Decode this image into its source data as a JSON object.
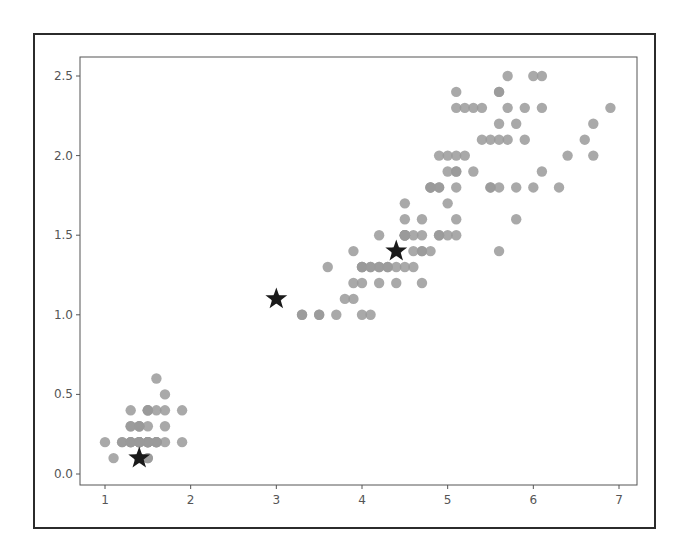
{
  "chart_data": {
    "type": "scatter",
    "title": "",
    "xlabel": "",
    "ylabel": "",
    "xlim": [
      0.705,
      7.195
    ],
    "ylim": [
      -0.07,
      2.62
    ],
    "grid": false,
    "legend": null,
    "x_ticks": [
      "1",
      "2",
      "3",
      "4",
      "5",
      "6",
      "7"
    ],
    "y_ticks": [
      "0.0",
      "0.5",
      "1.0",
      "1.5",
      "2.0",
      "2.5"
    ],
    "colors": {
      "points": "#9a9a9a",
      "stars": "#1a1a1a",
      "axes": "#555555",
      "frame": "#2b2b2b"
    },
    "series": [
      {
        "name": "points",
        "marker": "circle",
        "points": [
          [
            1.4,
            0.2
          ],
          [
            1.4,
            0.2
          ],
          [
            1.3,
            0.2
          ],
          [
            1.5,
            0.2
          ],
          [
            1.4,
            0.2
          ],
          [
            1.7,
            0.4
          ],
          [
            1.4,
            0.3
          ],
          [
            1.5,
            0.2
          ],
          [
            1.4,
            0.2
          ],
          [
            1.5,
            0.1
          ],
          [
            1.5,
            0.2
          ],
          [
            1.6,
            0.2
          ],
          [
            1.4,
            0.1
          ],
          [
            1.1,
            0.1
          ],
          [
            1.2,
            0.2
          ],
          [
            1.5,
            0.4
          ],
          [
            1.3,
            0.4
          ],
          [
            1.4,
            0.3
          ],
          [
            1.7,
            0.3
          ],
          [
            1.5,
            0.3
          ],
          [
            1.7,
            0.2
          ],
          [
            1.5,
            0.4
          ],
          [
            1.0,
            0.2
          ],
          [
            1.7,
            0.5
          ],
          [
            1.9,
            0.2
          ],
          [
            1.6,
            0.2
          ],
          [
            1.6,
            0.4
          ],
          [
            1.5,
            0.2
          ],
          [
            1.4,
            0.2
          ],
          [
            1.6,
            0.2
          ],
          [
            1.6,
            0.2
          ],
          [
            1.5,
            0.4
          ],
          [
            1.5,
            0.1
          ],
          [
            1.4,
            0.2
          ],
          [
            1.5,
            0.2
          ],
          [
            1.2,
            0.2
          ],
          [
            1.3,
            0.2
          ],
          [
            1.4,
            0.1
          ],
          [
            1.3,
            0.2
          ],
          [
            1.5,
            0.2
          ],
          [
            1.3,
            0.3
          ],
          [
            1.3,
            0.3
          ],
          [
            1.3,
            0.2
          ],
          [
            1.6,
            0.6
          ],
          [
            1.9,
            0.4
          ],
          [
            1.4,
            0.3
          ],
          [
            1.6,
            0.2
          ],
          [
            1.4,
            0.2
          ],
          [
            1.5,
            0.2
          ],
          [
            1.4,
            0.2
          ],
          [
            4.7,
            1.4
          ],
          [
            4.5,
            1.5
          ],
          [
            4.9,
            1.5
          ],
          [
            4.0,
            1.3
          ],
          [
            4.6,
            1.5
          ],
          [
            4.5,
            1.3
          ],
          [
            4.7,
            1.6
          ],
          [
            3.3,
            1.0
          ],
          [
            4.6,
            1.3
          ],
          [
            3.9,
            1.4
          ],
          [
            3.5,
            1.0
          ],
          [
            4.2,
            1.5
          ],
          [
            4.0,
            1.0
          ],
          [
            4.7,
            1.4
          ],
          [
            3.6,
            1.3
          ],
          [
            4.4,
            1.4
          ],
          [
            4.5,
            1.5
          ],
          [
            4.1,
            1.0
          ],
          [
            4.5,
            1.5
          ],
          [
            3.9,
            1.1
          ],
          [
            4.8,
            1.8
          ],
          [
            4.0,
            1.3
          ],
          [
            4.9,
            1.5
          ],
          [
            4.7,
            1.2
          ],
          [
            4.3,
            1.3
          ],
          [
            4.4,
            1.4
          ],
          [
            4.8,
            1.4
          ],
          [
            5.0,
            1.7
          ],
          [
            4.5,
            1.5
          ],
          [
            3.5,
            1.0
          ],
          [
            3.8,
            1.1
          ],
          [
            3.7,
            1.0
          ],
          [
            3.9,
            1.2
          ],
          [
            5.1,
            1.6
          ],
          [
            4.5,
            1.5
          ],
          [
            4.5,
            1.6
          ],
          [
            4.7,
            1.5
          ],
          [
            4.4,
            1.3
          ],
          [
            4.1,
            1.3
          ],
          [
            4.0,
            1.3
          ],
          [
            4.4,
            1.2
          ],
          [
            4.6,
            1.4
          ],
          [
            4.0,
            1.2
          ],
          [
            3.3,
            1.0
          ],
          [
            4.2,
            1.3
          ],
          [
            4.2,
            1.2
          ],
          [
            4.2,
            1.3
          ],
          [
            4.3,
            1.3
          ],
          [
            3.0,
            1.1
          ],
          [
            4.1,
            1.3
          ],
          [
            6.0,
            2.5
          ],
          [
            5.1,
            1.9
          ],
          [
            5.9,
            2.1
          ],
          [
            5.6,
            1.8
          ],
          [
            5.8,
            2.2
          ],
          [
            6.6,
            2.1
          ],
          [
            4.5,
            1.7
          ],
          [
            6.3,
            1.8
          ],
          [
            5.8,
            1.8
          ],
          [
            6.1,
            2.5
          ],
          [
            5.1,
            2.0
          ],
          [
            5.3,
            1.9
          ],
          [
            5.5,
            2.1
          ],
          [
            5.0,
            2.0
          ],
          [
            5.1,
            2.4
          ],
          [
            5.3,
            2.3
          ],
          [
            5.5,
            1.8
          ],
          [
            6.7,
            2.2
          ],
          [
            6.9,
            2.3
          ],
          [
            5.0,
            1.5
          ],
          [
            5.7,
            2.3
          ],
          [
            4.9,
            2.0
          ],
          [
            6.7,
            2.0
          ],
          [
            4.9,
            1.8
          ],
          [
            5.7,
            2.1
          ],
          [
            6.0,
            1.8
          ],
          [
            4.8,
            1.8
          ],
          [
            4.9,
            1.8
          ],
          [
            5.6,
            2.1
          ],
          [
            5.8,
            1.6
          ],
          [
            6.1,
            1.9
          ],
          [
            6.4,
            2.0
          ],
          [
            5.6,
            2.2
          ],
          [
            5.1,
            1.5
          ],
          [
            5.6,
            1.4
          ],
          [
            6.1,
            2.3
          ],
          [
            5.6,
            2.4
          ],
          [
            5.5,
            1.8
          ],
          [
            4.8,
            1.8
          ],
          [
            5.4,
            2.1
          ],
          [
            5.6,
            2.4
          ],
          [
            5.1,
            2.3
          ],
          [
            5.1,
            1.9
          ],
          [
            5.9,
            2.3
          ],
          [
            5.7,
            2.5
          ],
          [
            5.2,
            2.3
          ],
          [
            5.0,
            1.9
          ],
          [
            5.2,
            2.0
          ],
          [
            5.4,
            2.3
          ],
          [
            5.1,
            1.8
          ]
        ]
      },
      {
        "name": "stars",
        "marker": "star",
        "points": [
          [
            1.4,
            0.1
          ],
          [
            3.0,
            1.1
          ],
          [
            4.4,
            1.4
          ]
        ]
      }
    ]
  }
}
